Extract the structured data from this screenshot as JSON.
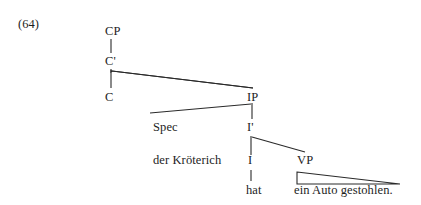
{
  "figure": {
    "example_number": "(64)",
    "type": "syntax-tree",
    "language": "German",
    "sentence": "der Kröterich hat ein Auto gestohlen."
  },
  "nodes": {
    "cp": "CP",
    "cbar": "C'",
    "c": "C",
    "ip": "IP",
    "spec": "Spec",
    "ibar": "I'",
    "i": "I",
    "vp": "VP"
  },
  "terminals": {
    "spec_content": "der Kröterich",
    "i_content": "hat",
    "vp_content": "ein Auto gestohlen."
  },
  "style": {
    "line_color": "#2a2a2a",
    "text_color": "#1d1d1d",
    "background": "#ffffff"
  }
}
